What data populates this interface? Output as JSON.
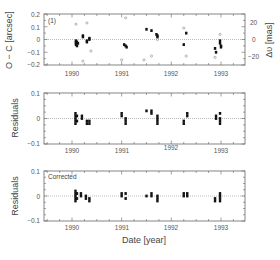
{
  "chart_data": [
    {
      "type": "scatter",
      "panel": "top",
      "annotation": "(1)",
      "ylabel": "O − C [arcsec]",
      "ylabel_right": "Δυ [mas]",
      "ylim": [
        -0.2,
        0.2
      ],
      "yticks": [
        "0.2",
        "0.1",
        "0",
        "−0.1",
        "−0.2"
      ],
      "yticks_right": [
        "20",
        "0",
        "−20"
      ],
      "xticks": [
        "1990",
        "1991",
        "1992",
        "1993"
      ],
      "xlim": [
        1989.45,
        1993.5
      ],
      "grid": false,
      "zero_line": true,
      "series": [
        {
          "name": "O-C (filled)",
          "marker": "filled-square",
          "points": [
            [
              1990.08,
              -0.01
            ],
            [
              1990.08,
              -0.02
            ],
            [
              1990.08,
              -0.03
            ],
            [
              1990.08,
              -0.04
            ],
            [
              1990.1,
              -0.02
            ],
            [
              1990.1,
              -0.05
            ],
            [
              1990.12,
              -0.03
            ],
            [
              1990.22,
              0.02
            ],
            [
              1990.22,
              0.03
            ],
            [
              1990.3,
              -0.02
            ],
            [
              1990.3,
              -0.01
            ],
            [
              1990.35,
              0.0
            ],
            [
              1990.35,
              0.01
            ],
            [
              1991.05,
              -0.04
            ],
            [
              1991.08,
              -0.05
            ],
            [
              1991.1,
              -0.06
            ],
            [
              1991.5,
              0.08
            ],
            [
              1991.6,
              0.07
            ],
            [
              1991.7,
              0.04
            ],
            [
              1991.72,
              0.03
            ],
            [
              1991.72,
              0.02
            ],
            [
              1992.25,
              -0.04
            ],
            [
              1992.3,
              0.05
            ],
            [
              1992.88,
              -0.07
            ],
            [
              1992.9,
              -0.1
            ],
            [
              1992.98,
              -0.01
            ],
            [
              1992.98,
              -0.03
            ],
            [
              1993.0,
              -0.05
            ],
            [
              1993.0,
              -0.06
            ]
          ]
        },
        {
          "name": "Δυ (open)",
          "marker": "open-circle",
          "points": [
            [
              1990.08,
              0.12
            ],
            [
              1990.3,
              0.13
            ],
            [
              1990.38,
              -0.09
            ],
            [
              1990.22,
              -0.17
            ],
            [
              1991.08,
              0.17
            ],
            [
              1991.0,
              -0.16
            ],
            [
              1991.45,
              -0.16
            ],
            [
              1991.6,
              -0.13
            ],
            [
              1991.72,
              0.0
            ],
            [
              1992.25,
              0.09
            ],
            [
              1992.3,
              -0.13
            ],
            [
              1992.88,
              -0.14
            ],
            [
              1992.98,
              0.04
            ]
          ]
        }
      ]
    },
    {
      "type": "scatter",
      "panel": "middle",
      "ylabel": "Residuals",
      "ylim": [
        -0.1,
        0.1
      ],
      "yticks": [
        "0.1",
        "0",
        "−0.1"
      ],
      "xticks": [
        "1990",
        "1991",
        "1992",
        "1993"
      ],
      "zero_line": true,
      "series": [
        {
          "name": "Residuals",
          "marker": "filled-square",
          "points": [
            [
              1990.07,
              0.02
            ],
            [
              1990.07,
              0.01
            ],
            [
              1990.07,
              0.0
            ],
            [
              1990.07,
              -0.01
            ],
            [
              1990.07,
              -0.02
            ],
            [
              1990.1,
              0.01
            ],
            [
              1990.1,
              -0.01
            ],
            [
              1990.2,
              0.01
            ],
            [
              1990.2,
              0.0
            ],
            [
              1990.3,
              -0.01
            ],
            [
              1990.3,
              -0.02
            ],
            [
              1990.35,
              -0.01
            ],
            [
              1990.35,
              -0.02
            ],
            [
              1991.0,
              0.02
            ],
            [
              1991.0,
              0.01
            ],
            [
              1991.08,
              0.0
            ],
            [
              1991.08,
              -0.01
            ],
            [
              1991.08,
              -0.02
            ],
            [
              1991.5,
              0.03
            ],
            [
              1991.6,
              0.03
            ],
            [
              1991.6,
              0.02
            ],
            [
              1991.72,
              0.01
            ],
            [
              1991.72,
              0.0
            ],
            [
              1991.72,
              -0.01
            ],
            [
              1991.72,
              -0.02
            ],
            [
              1992.25,
              -0.01
            ],
            [
              1992.25,
              -0.02
            ],
            [
              1992.32,
              0.02
            ],
            [
              1992.32,
              0.01
            ],
            [
              1992.9,
              0.01
            ],
            [
              1992.9,
              0.0
            ],
            [
              1992.98,
              0.02
            ],
            [
              1992.98,
              0.0
            ],
            [
              1992.98,
              -0.01
            ],
            [
              1992.98,
              -0.02
            ]
          ]
        }
      ]
    },
    {
      "type": "scatter",
      "panel": "bottom",
      "annotation": "Corrected",
      "ylabel": "Residuals",
      "xlabel": "Date [year]",
      "ylim": [
        -0.1,
        0.1
      ],
      "yticks": [
        "0.1",
        "0",
        "−0.1"
      ],
      "xticks": [
        "1990",
        "1991",
        "1992",
        "1993"
      ],
      "zero_line": true,
      "series": [
        {
          "name": "Corrected residuals",
          "marker": "filled-square",
          "points": [
            [
              1990.07,
              0.02
            ],
            [
              1990.07,
              0.01
            ],
            [
              1990.07,
              0.0
            ],
            [
              1990.07,
              -0.01
            ],
            [
              1990.07,
              -0.02
            ],
            [
              1990.1,
              0.01
            ],
            [
              1990.1,
              -0.01
            ],
            [
              1990.18,
              0.01
            ],
            [
              1990.18,
              0.0
            ],
            [
              1990.28,
              0.0
            ],
            [
              1990.28,
              -0.01
            ],
            [
              1990.35,
              -0.01
            ],
            [
              1990.35,
              -0.02
            ],
            [
              1991.0,
              0.01
            ],
            [
              1991.0,
              0.0
            ],
            [
              1991.08,
              0.01
            ],
            [
              1991.08,
              -0.01
            ],
            [
              1991.5,
              0.0
            ],
            [
              1991.6,
              0.01
            ],
            [
              1991.6,
              0.0
            ],
            [
              1991.72,
              0.0
            ],
            [
              1991.72,
              -0.01
            ],
            [
              1991.72,
              -0.02
            ],
            [
              1992.25,
              0.01
            ],
            [
              1992.25,
              0.0
            ],
            [
              1992.32,
              0.01
            ],
            [
              1992.32,
              0.0
            ],
            [
              1992.88,
              -0.01
            ],
            [
              1992.88,
              -0.02
            ],
            [
              1992.98,
              0.01
            ],
            [
              1992.98,
              0.0
            ],
            [
              1992.98,
              -0.01
            ],
            [
              1992.98,
              -0.02
            ]
          ]
        }
      ]
    }
  ],
  "labels": {
    "top_ylabel": "O − C [arcsec]",
    "top_ylabel_right": "Δυ [mas]",
    "mid_ylabel": "Residuals",
    "bot_ylabel": "Residuals",
    "xlabel": "Date [year]",
    "top_note": "(1)",
    "bot_note": "Corrected",
    "top_yticks": [
      "0.2",
      "0.1",
      "0",
      "−0.1",
      "−0.2"
    ],
    "top_yticks_right": [
      "20",
      "0",
      "−20"
    ],
    "res_yticks": [
      "0.1",
      "0",
      "−0.1"
    ],
    "xticks": [
      "1990",
      "1991",
      "1992",
      "1993"
    ]
  }
}
